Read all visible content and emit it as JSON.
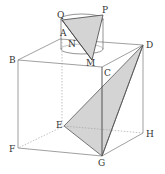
{
  "figure": {
    "labels": {
      "Q": "Q",
      "P": "P",
      "A": "A",
      "N": "N",
      "M": "M",
      "B": "B",
      "C": "C",
      "D": "D",
      "E": "E",
      "F": "F",
      "G": "G",
      "H": "H"
    },
    "colors": {
      "line": "#555555",
      "shade": "#d4d4d4",
      "dashed": "#888888"
    }
  }
}
